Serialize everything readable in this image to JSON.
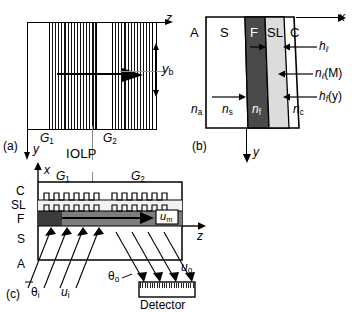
{
  "figure": {
    "caption_panels": [
      "(a)",
      "(b)",
      "(c)"
    ],
    "center_label": "IOLP"
  },
  "panel_a": {
    "tag": "(a)",
    "axis_z": "z",
    "axis_y": "y",
    "grating_1": "G",
    "grating_1_sub": "1",
    "grating_2": "G",
    "grating_2_sub": "2",
    "beam_width_label": "y",
    "beam_width_sub": "b"
  },
  "panel_b": {
    "tag": "(b)",
    "axis_x": "x",
    "axis_y": "y",
    "layers": [
      {
        "name": "layer-A",
        "label": "A"
      },
      {
        "name": "layer-S",
        "label": "S"
      },
      {
        "name": "layer-F",
        "label": "F"
      },
      {
        "name": "layer-SL",
        "label": "SL"
      },
      {
        "name": "layer-C",
        "label": "C"
      }
    ],
    "indices": [
      {
        "name": "index-na",
        "base": "n",
        "sub": "a"
      },
      {
        "name": "index-ns",
        "base": "n",
        "sub": "s"
      },
      {
        "name": "index-nf",
        "base": "n",
        "sub": "f"
      },
      {
        "name": "index-nc",
        "base": "n",
        "sub": "c"
      }
    ],
    "callouts": [
      {
        "name": "thickness-h-ell",
        "base": "h",
        "sub": "ℓ",
        "suffix": ""
      },
      {
        "name": "index-n-ell-M",
        "base": "n",
        "sub": "ℓ",
        "suffix": "(M)"
      },
      {
        "name": "thickness-hf-y",
        "base": "h",
        "sub": "f",
        "suffix": "(y)"
      }
    ]
  },
  "panel_c": {
    "tag": "(c)",
    "axis_x": "x",
    "axis_z": "z",
    "layers": [
      {
        "name": "layer-C",
        "label": "C"
      },
      {
        "name": "layer-SL",
        "label": "SL"
      },
      {
        "name": "layer-F",
        "label": "F"
      },
      {
        "name": "layer-S",
        "label": "S"
      },
      {
        "name": "layer-A",
        "label": "A"
      }
    ],
    "grating_1": "G",
    "grating_1_sub": "1",
    "grating_2": "G",
    "grating_2_sub": "2",
    "mode_label": "u",
    "mode_sub": "m",
    "input_beam": "u",
    "input_beam_sub": "i",
    "output_beam": "u",
    "output_beam_sub": "o",
    "angle_in": "θ",
    "angle_in_sub": "i",
    "angle_out": "θ",
    "angle_out_sub": "o",
    "detector": "Detector"
  },
  "colors": {
    "stroke": "#000000",
    "film_dark": "#4a4a4a",
    "sl_light": "#d9d9d9",
    "background": "#ffffff",
    "guide_gray": "#8c8c8c"
  }
}
